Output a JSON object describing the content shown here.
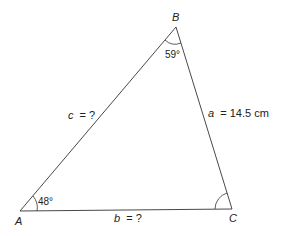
{
  "diagram": {
    "type": "triangle",
    "vertices": {
      "A": {
        "label": "A",
        "angle": "48°"
      },
      "B": {
        "label": "B",
        "angle": "59°"
      },
      "C": {
        "label": "C",
        "angle": ""
      }
    },
    "sides": {
      "a": {
        "name": "a",
        "value": "= 14.5 cm"
      },
      "b": {
        "name": "b",
        "value": "= ?"
      },
      "c": {
        "name": "c",
        "value": "= ?"
      }
    },
    "colors": {
      "line": "#333333",
      "text": "#222222",
      "background": "#ffffff"
    }
  }
}
